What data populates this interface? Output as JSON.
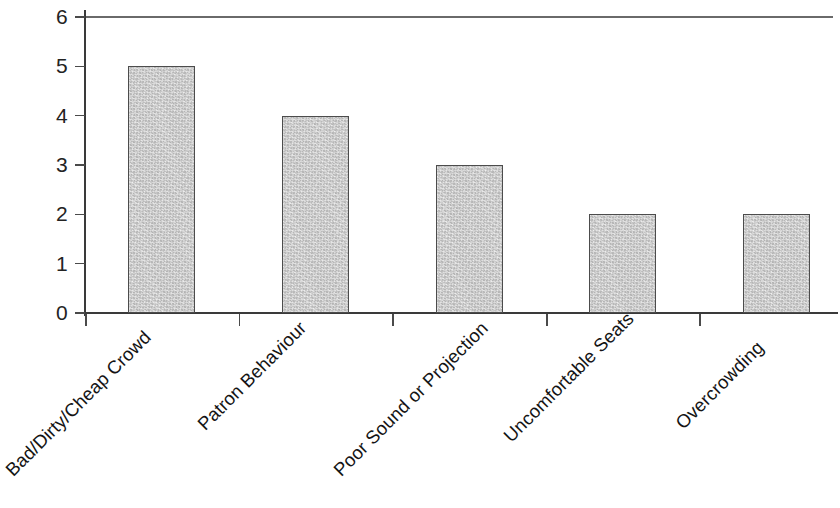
{
  "chart_data": {
    "type": "bar",
    "title": "",
    "subtitle": "",
    "xlabel": "",
    "ylabel": "",
    "categories": [
      "Bad/Dirty/Cheap Crowd",
      "Patron Behaviour",
      "Poor Sound or Projection",
      "Uncomfortable Seats",
      "Overcrowding"
    ],
    "values": [
      5,
      4,
      3,
      2,
      2
    ],
    "ylim": [
      0,
      6
    ],
    "ytick_labels": [
      "6",
      "5",
      "4",
      "3",
      "2",
      "1",
      "0"
    ],
    "ytick_values": [
      6,
      5,
      4,
      3,
      2,
      1,
      0
    ],
    "grid": false,
    "legend": null,
    "legend_position": "none",
    "annotations": [],
    "bar_fill_color": "#c9c9c9",
    "bar_edge_color": "#4c4c4c",
    "axis_color": "#3a3a3a",
    "background_color": "#ffffff",
    "label_rotation_degrees": -45
  }
}
